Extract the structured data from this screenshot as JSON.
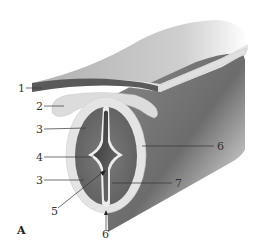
{
  "figure": {
    "panel_label": "A",
    "colors": {
      "background": "#ffffff",
      "outer_tube_dark": "#6e6e6e",
      "outer_tube_light": "#e6e6e6",
      "top_sheet_surface": "#9a9a9a",
      "top_sheet_edge": "#555555",
      "fold_pale": "#d9d9d9",
      "marginal_layer": "#dcdcdc",
      "mantle_layer": "#6b6b6b",
      "lining": "#e8e8e8",
      "canal": "#4a4a4a",
      "label_text": "#333333"
    },
    "labels": [
      {
        "id": "label-1",
        "text": "1",
        "x": 18,
        "y": 92
      },
      {
        "id": "label-2",
        "text": "2",
        "x": 36,
        "y": 110
      },
      {
        "id": "label-3a",
        "text": "3",
        "x": 36,
        "y": 133
      },
      {
        "id": "label-4",
        "text": "4",
        "x": 36,
        "y": 161
      },
      {
        "id": "label-3b",
        "text": "3",
        "x": 36,
        "y": 184
      },
      {
        "id": "label-5",
        "text": "5",
        "x": 51,
        "y": 215
      },
      {
        "id": "label-6a",
        "text": "6",
        "x": 102,
        "y": 238
      },
      {
        "id": "label-6b",
        "text": "6",
        "x": 217,
        "y": 150
      },
      {
        "id": "label-7",
        "text": "7",
        "x": 175,
        "y": 187
      }
    ]
  }
}
